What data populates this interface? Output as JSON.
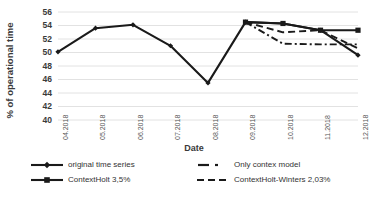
{
  "chart_data": {
    "type": "line",
    "title": "",
    "xlabel": "Date",
    "ylabel": "% of operational time",
    "categories": [
      "04.2018",
      "05.2018",
      "06.2018",
      "07.2018",
      "08.2018",
      "09.2018",
      "10.2018",
      "11.2018",
      "12.2018"
    ],
    "ylim": [
      40,
      56
    ],
    "yticks": [
      40,
      42,
      44,
      46,
      48,
      50,
      52,
      54,
      56
    ],
    "grid": true,
    "legend_position": "bottom",
    "series": [
      {
        "name": "original time series",
        "style": "solid-marker-diamond",
        "x": [
          "04.2018",
          "05.2018",
          "06.2018",
          "07.2018",
          "08.2018",
          "09.2018",
          "10.2018",
          "11.2018",
          "12.2018"
        ],
        "values": [
          50.1,
          53.6,
          54.1,
          51.0,
          45.5,
          54.5,
          54.3,
          53.3,
          49.6
        ]
      },
      {
        "name": "ContextHolt 3,5%",
        "style": "solid-marker-square",
        "x": [
          "09.2018",
          "10.2018",
          "11.2018",
          "12.2018"
        ],
        "values": [
          54.5,
          54.3,
          53.3,
          53.3
        ]
      },
      {
        "name": "Only contex model",
        "style": "dash-dot",
        "x": [
          "09.2018",
          "10.2018",
          "11.2018",
          "12.2018"
        ],
        "values": [
          54.5,
          51.3,
          51.2,
          51.2
        ]
      },
      {
        "name": "ContextHolt-Winters 2,03%",
        "style": "dashed",
        "x": [
          "09.2018",
          "10.2018",
          "11.2018",
          "12.2018"
        ],
        "values": [
          54.5,
          53.0,
          53.3,
          50.6
        ]
      }
    ]
  },
  "axis": {
    "ylabel": "% of operational time",
    "xlabel": "Date",
    "yticks": [
      "56",
      "54",
      "52",
      "50",
      "48",
      "46",
      "44",
      "42",
      "40"
    ],
    "xticks": [
      "04.2018",
      "05.2018",
      "06.2018",
      "07.2018",
      "08.2018",
      "09.2018",
      "10.2018",
      "11.2018",
      "12.2018"
    ]
  },
  "legend": {
    "items": [
      {
        "label": "original time series",
        "symbol": "solid-diamond-line"
      },
      {
        "label": "ContextHolt 3,5%",
        "symbol": "solid-square-line"
      },
      {
        "label": "Only contex model",
        "symbol": "dash-dot-line"
      },
      {
        "label": "ContextHolt-Winters 2,03%",
        "symbol": "dashed-line"
      }
    ]
  },
  "colors": {
    "series": "#1a1a1a",
    "grid": "#e2e2e2",
    "text": "#3a3a3a"
  }
}
